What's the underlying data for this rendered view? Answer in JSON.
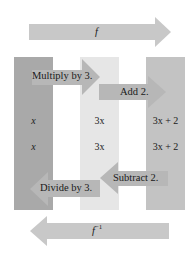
{
  "top_arrow": {
    "label": "f",
    "direction": "right",
    "color": "#c8c8c8"
  },
  "bottom_arrow": {
    "label": "f",
    "superscript": "−1",
    "direction": "left",
    "color": "#c8c8c8"
  },
  "columns": [
    {
      "id": "left",
      "color": "#a9a9a9",
      "values": [
        "x",
        "x"
      ]
    },
    {
      "id": "middle",
      "color": "#e6e6e6",
      "values": [
        "3x",
        "3x"
      ]
    },
    {
      "id": "right",
      "color": "#c3c3c3",
      "values": [
        "3x + 2",
        "3x + 2"
      ]
    }
  ],
  "steps": {
    "forward": [
      {
        "label": "Multiply by 3.",
        "direction": "right"
      },
      {
        "label": "Add 2.",
        "direction": "right"
      }
    ],
    "inverse": [
      {
        "label": "Subtract 2.",
        "direction": "left"
      },
      {
        "label": "Divide by 3.",
        "direction": "left"
      }
    ]
  },
  "colors": {
    "step_arrow": "#b7b7b7",
    "background": "#ffffff"
  }
}
